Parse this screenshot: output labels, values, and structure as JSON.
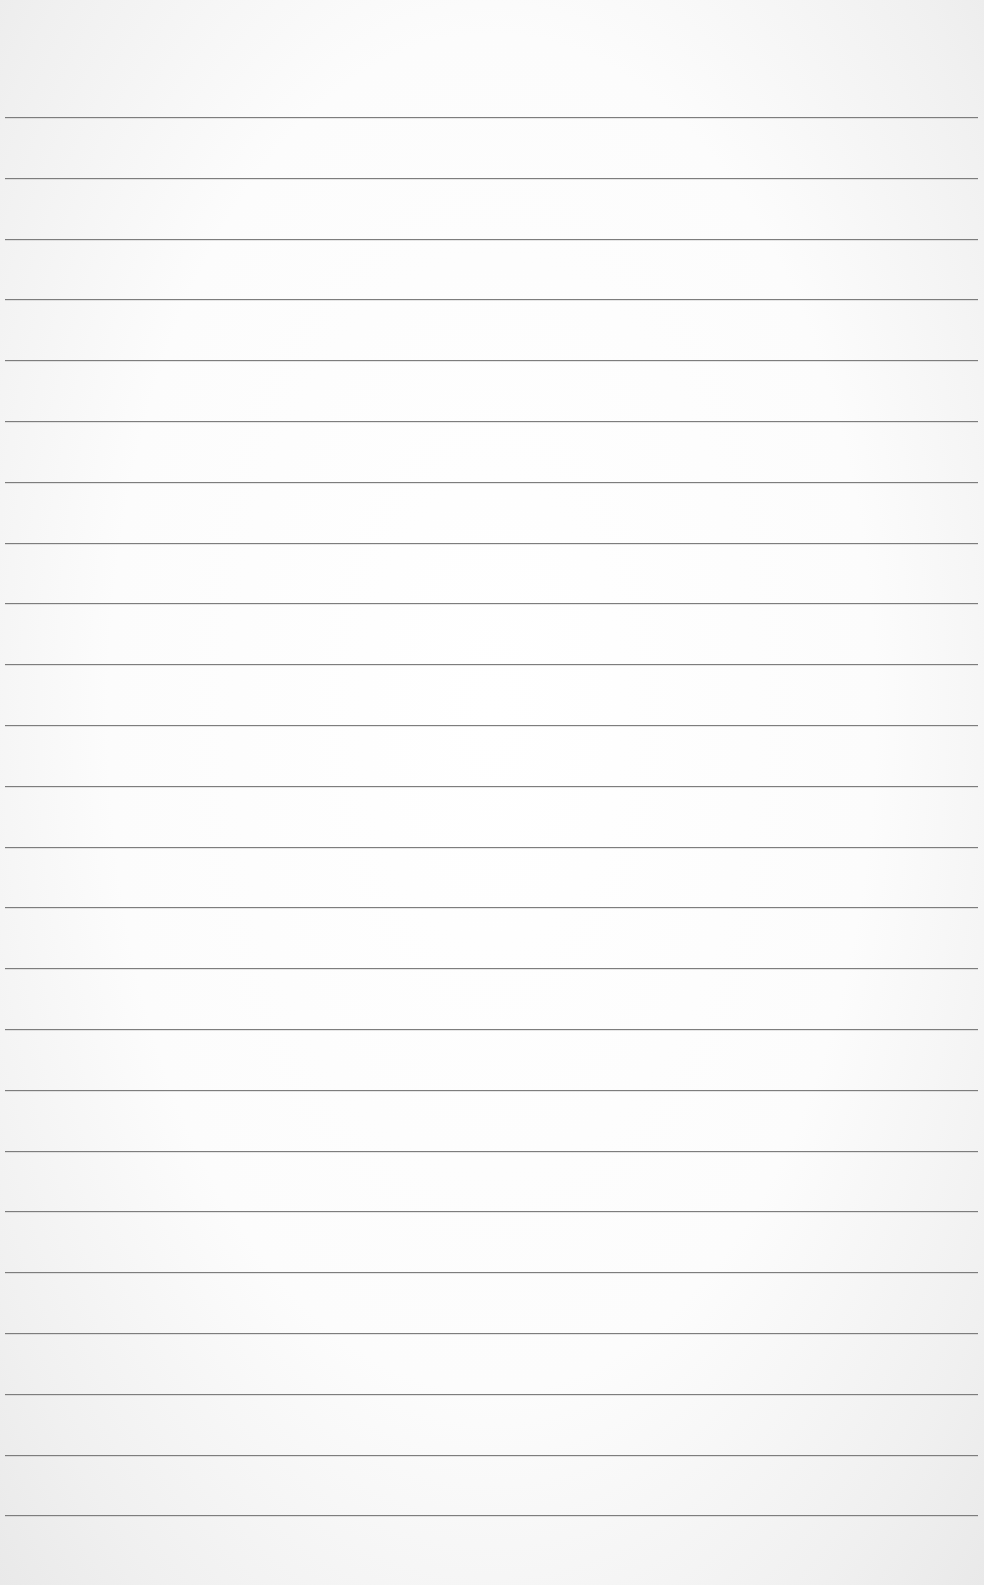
{
  "page": {
    "type": "lined-paper",
    "background_color": "#fdfdfd",
    "rule_color": "#7d7d7d",
    "rule_count": 24,
    "first_rule_y": 117,
    "rule_spacing": 60.8,
    "rule_left": 5,
    "rule_right_margin": 6,
    "content_text": ""
  }
}
